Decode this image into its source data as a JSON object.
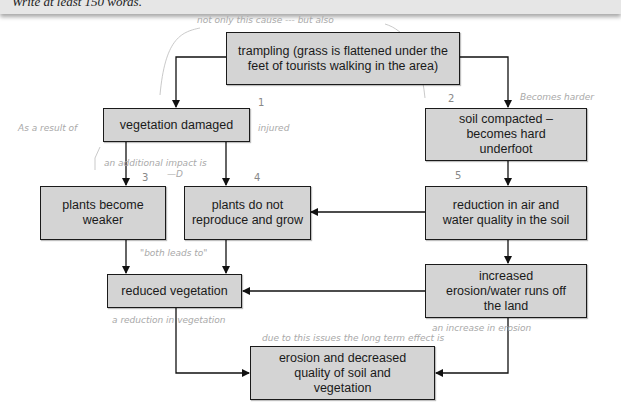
{
  "instruction": "Write at least 150 words.",
  "boxes": {
    "trampling": "trampling (grass is flattened under the feet of tourists walking in the area)",
    "vegetation_damaged": "vegetation damaged",
    "soil_compacted": "soil compacted – becomes hard underfoot",
    "plants_weaker": "plants become weaker",
    "plants_not_reproduce": "plants do not reproduce and grow",
    "reduction_air_water": "reduction in air and water quality in the soil",
    "reduced_vegetation": "reduced vegetation",
    "increased_erosion": "increased erosion/water runs off the land",
    "erosion_decreased_quality": "erosion and decreased quality of soil and vegetation"
  },
  "annotations": {
    "top": "not only this cause --- but also",
    "as_result": "As a result of",
    "injured": "injured",
    "additional_impact": "an additional impact is",
    "arrow": "—D",
    "becomes_harder": "Becomes harder",
    "both_leads_to": "\"both leads to\"",
    "reduction_in_vegetation": "a reduction in vegetation",
    "increase_in_erosion": "an increase in erosion",
    "long_term": "due to this issues the long term effect is"
  },
  "numbers": {
    "n1": "1",
    "n2": "2",
    "n3": "3",
    "n4": "4",
    "n5": "5"
  },
  "colors": {
    "box_fill": "#d4d4d4",
    "box_border": "#1a1a1a",
    "handwriting": "#a9a9a9"
  }
}
